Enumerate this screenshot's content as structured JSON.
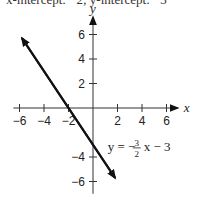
{
  "caption": "x-intercept: −2; y-intercept: −3",
  "chart_data": {
    "type": "line",
    "title": "",
    "xlabel": "x",
    "ylabel": "y",
    "xlim": [
      -6.5,
      7
    ],
    "ylim": [
      -7,
      7.5
    ],
    "x_ticks": [
      -6,
      -4,
      -2,
      2,
      4,
      6
    ],
    "y_ticks": [
      6,
      4,
      2,
      -4,
      -6
    ],
    "x_tick_labels": [
      "−6",
      "−4",
      "−2",
      "2",
      "4",
      "6"
    ],
    "y_tick_labels": [
      "6",
      "4",
      "2",
      "−4",
      "−6"
    ],
    "grid": false,
    "series": [
      {
        "name": "y = −3/2 x − 3",
        "equation": "y = -(3/2)x - 3",
        "slope": -1.5,
        "intercept": -3,
        "x": [
          -5.8,
          1.8
        ],
        "y": [
          5.7,
          -5.7
        ]
      }
    ],
    "annotations": [
      {
        "text_prefix": "y = −",
        "frac_num": "3",
        "frac_den": "2",
        "text_suffix": "x − 3",
        "x": 1.2,
        "y": -3.5
      }
    ]
  }
}
